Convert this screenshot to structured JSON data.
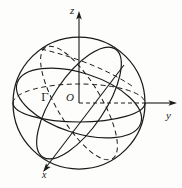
{
  "figure": {
    "kind": "sphere-coordinate-diagram",
    "background_color": "#fdfdfc",
    "stroke_color": "#1a1a1a",
    "axes": {
      "z": {
        "label": "z",
        "direction": "up"
      },
      "y": {
        "label": "y",
        "direction": "right"
      },
      "x": {
        "label": "x",
        "direction": "down-left"
      }
    },
    "origin": {
      "label": "O"
    },
    "curves": [
      {
        "name": "sphere-outline",
        "label": "",
        "style": "solid"
      },
      {
        "name": "great-circle-gamma",
        "label": "Γ",
        "style": "solid"
      },
      {
        "name": "equator-ellipse",
        "label": "",
        "style": "mixed"
      },
      {
        "name": "meridian-ellipse",
        "label": "",
        "style": "dashed"
      }
    ],
    "labels": {
      "z_axis": "z",
      "y_axis": "y",
      "x_axis": "x",
      "origin": "O",
      "gamma_curve": "Γ"
    }
  }
}
